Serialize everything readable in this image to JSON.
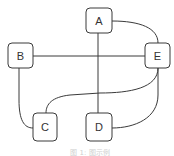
{
  "diagram": {
    "type": "graph",
    "nodes": [
      {
        "id": "A",
        "label": "A",
        "x": 86,
        "y": 8,
        "w": 26,
        "h": 25
      },
      {
        "id": "B",
        "label": "B",
        "x": 8,
        "y": 43,
        "w": 25,
        "h": 25
      },
      {
        "id": "E",
        "label": "E",
        "x": 145,
        "y": 43,
        "w": 25,
        "h": 25
      },
      {
        "id": "C",
        "label": "C",
        "x": 33,
        "y": 113,
        "w": 24,
        "h": 28
      },
      {
        "id": "D",
        "label": "D",
        "x": 86,
        "y": 113,
        "w": 26,
        "h": 28
      }
    ],
    "edges": [
      {
        "from": "A",
        "to": "D",
        "shape": "straight"
      },
      {
        "from": "B",
        "to": "E",
        "shape": "straight"
      },
      {
        "from": "A",
        "to": "E",
        "shape": "curve"
      },
      {
        "from": "B",
        "to": "C",
        "shape": "curve"
      },
      {
        "from": "E",
        "to": "C",
        "shape": "curve"
      },
      {
        "from": "E",
        "to": "D",
        "shape": "curve"
      }
    ],
    "caption": "图 1: 图示例",
    "colors": {
      "stroke": "#3a3a3a",
      "label": "#333333",
      "caption": "#cfcfcf",
      "background": "#ffffff"
    }
  }
}
